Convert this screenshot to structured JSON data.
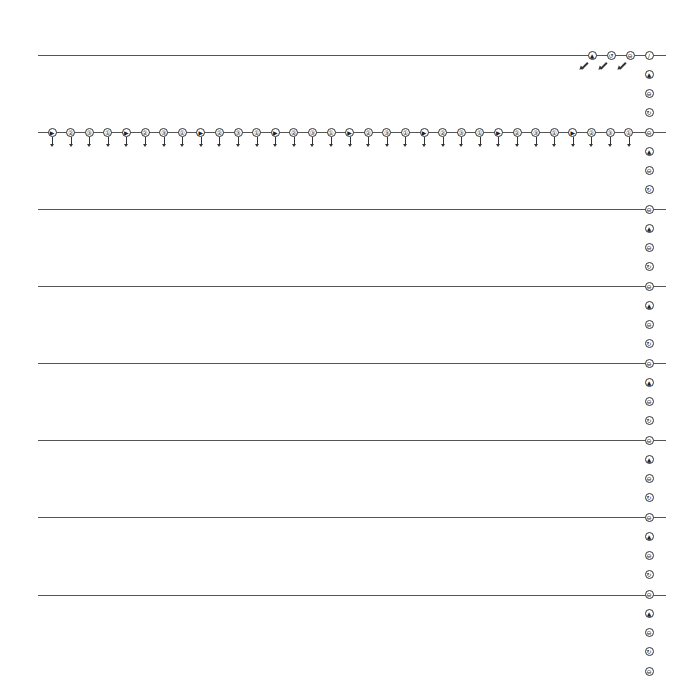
{
  "diagram": {
    "line_color": "#555555",
    "node_color": "#333333",
    "lines": [
      {
        "y": 55,
        "x1": 38,
        "x2": 666
      },
      {
        "y": 132,
        "x1": 38,
        "x2": 666
      },
      {
        "y": 209,
        "x1": 38,
        "x2": 666
      },
      {
        "y": 286,
        "x1": 38,
        "x2": 666
      },
      {
        "y": 363,
        "x1": 38,
        "x2": 666
      },
      {
        "y": 440,
        "x1": 38,
        "x2": 666
      },
      {
        "y": 517,
        "x1": 38,
        "x2": 666
      },
      {
        "y": 595,
        "x1": 38,
        "x2": 666
      }
    ],
    "top_row": {
      "y": 55,
      "nodes": [
        {
          "x": 592,
          "glyph": "▲",
          "arrow": "diagonal-down-left"
        },
        {
          "x": 611,
          "glyph": "↺",
          "arrow": "diagonal-down-left"
        },
        {
          "x": 630,
          "glyph": "⊖",
          "arrow": "diagonal-down-left"
        },
        {
          "x": 649,
          "glyph": "/",
          "arrow": "none"
        }
      ]
    },
    "main_row": {
      "y": 132,
      "node_count": 32,
      "x_start": 52,
      "spacing": 18.6,
      "glyphs": [
        "▶",
        "②",
        "③",
        "①",
        "▶",
        "②",
        "③",
        "①",
        "▶",
        "②",
        "③",
        "①",
        "▶",
        "②",
        "③",
        "①",
        "▶",
        "②",
        "③",
        "①",
        "▶",
        "②",
        "③",
        "①",
        "▶",
        "②",
        "③",
        "①",
        "▶",
        "②",
        "③",
        "①"
      ],
      "arrow": "down"
    },
    "right_column": {
      "x": 649,
      "y_start": 55,
      "spacing": 19.25,
      "glyphs": [
        "/",
        "▲",
        "⊖",
        "↻",
        "⊖",
        "▲",
        "⊖",
        "↻",
        "⊖",
        "▲",
        "⊖",
        "↻",
        "⊖",
        "▲",
        "⊖",
        "↻",
        "⊖",
        "▲",
        "⊖",
        "↻",
        "⊖",
        "▲",
        "⊖",
        "↻",
        "⊖",
        "▲",
        "⊖",
        "↻",
        "⊖",
        "▲",
        "⊖",
        "↻",
        "⊖"
      ]
    }
  }
}
